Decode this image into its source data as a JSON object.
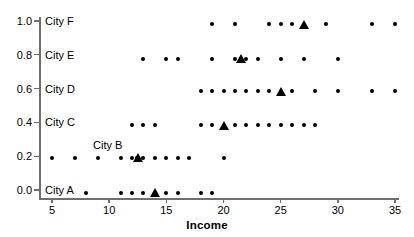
{
  "chart_data": {
    "type": "scatter",
    "title": "",
    "xlabel": "Income",
    "ylabel": "",
    "xlim": [
      3.5,
      35.8
    ],
    "ylim": [
      -0.07,
      1.06
    ],
    "grid": false,
    "legend": "none",
    "xticks": [
      5,
      10,
      15,
      20,
      25,
      30,
      35
    ],
    "xticklabels": [
      "5",
      "10",
      "15",
      "20",
      "25",
      "30",
      "35"
    ],
    "yticks": [
      0.0,
      0.2,
      0.4,
      0.6,
      0.8,
      1.0
    ],
    "yticklabels": [
      "0.0",
      "0.2",
      "0.4",
      "0.6",
      "0.8",
      "1.0"
    ],
    "marker_dot": "filled-circle",
    "marker_mean": "filled-triangle",
    "series": [
      {
        "name": "City A",
        "label": "City A",
        "label_x": 5.0,
        "label_y": 0.0,
        "y": -0.015,
        "values": [
          8,
          11,
          12,
          13,
          15,
          16,
          18,
          19
        ],
        "mean": 14
      },
      {
        "name": "City B",
        "label": "City B",
        "label_x": 9.2,
        "label_y": 0.265,
        "y": 0.19,
        "values": [
          5,
          7,
          9,
          11,
          12,
          12.4,
          13,
          14,
          15,
          16,
          17,
          20
        ],
        "mean": 12.5
      },
      {
        "name": "City C",
        "label": "City C",
        "label_x": 5.0,
        "label_y": 0.4,
        "y": 0.383,
        "values": [
          12,
          13,
          14,
          18,
          19,
          21,
          22,
          23,
          24,
          25,
          26,
          27,
          28
        ],
        "mean": 20
      },
      {
        "name": "City D",
        "label": "City D",
        "label_x": 5.0,
        "label_y": 0.6,
        "y": 0.585,
        "values": [
          18,
          19,
          20,
          21,
          22,
          23,
          24,
          26,
          28,
          30,
          33,
          35
        ],
        "mean": 25
      },
      {
        "name": "City E",
        "label": "City E",
        "label_x": 5.0,
        "label_y": 0.8,
        "y": 0.778,
        "values": [
          13,
          15,
          16,
          19,
          21,
          22,
          23,
          25,
          27,
          30
        ],
        "mean": 21.5
      },
      {
        "name": "City F",
        "label": "City F",
        "label_x": 5.0,
        "label_y": 1.0,
        "y": 0.982,
        "values": [
          19,
          21,
          24,
          25,
          26,
          29,
          33,
          35
        ],
        "mean": 27
      }
    ]
  },
  "colors": {
    "marker": "#000000",
    "axis": "#6e6e6e",
    "background": "#ffffff"
  }
}
